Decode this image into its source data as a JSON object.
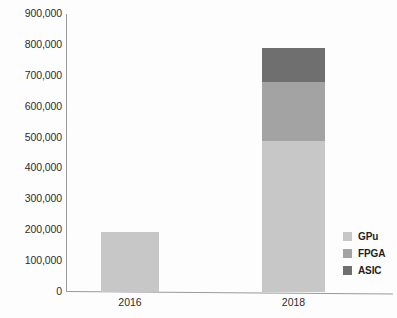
{
  "chart_data": {
    "type": "bar",
    "subtype": "stacked-bar",
    "title": "",
    "xlabel": "",
    "ylabel": "",
    "categories": [
      "2016",
      "2018"
    ],
    "series": [
      {
        "name": "GPu",
        "values": [
          195000,
          490000
        ],
        "color": "#c7c7c7"
      },
      {
        "name": "FPGA",
        "values": [
          0,
          190000
        ],
        "color": "#a3a3a3"
      },
      {
        "name": "ASIC",
        "values": [
          0,
          110000
        ],
        "color": "#6f6f6f"
      }
    ],
    "totals": [
      195000,
      790000
    ],
    "ylim": [
      0,
      900000
    ],
    "ytick_values": [
      0,
      100000,
      200000,
      300000,
      400000,
      500000,
      600000,
      700000,
      800000,
      900000
    ],
    "ytick_labels": [
      "0",
      "100,000",
      "200,000",
      "300,000",
      "400,000",
      "500,000",
      "600,000",
      "700,000",
      "800,000",
      "900,000"
    ],
    "grid": false,
    "legend_position": "right-bottom"
  },
  "axes": {
    "y_ticks": [
      {
        "label": "900,000",
        "value": 900000
      },
      {
        "label": "800,000",
        "value": 800000
      },
      {
        "label": "700,000",
        "value": 700000
      },
      {
        "label": "600,000",
        "value": 600000
      },
      {
        "label": "500,000",
        "value": 500000
      },
      {
        "label": "400,000",
        "value": 400000
      },
      {
        "label": "300,000",
        "value": 300000
      },
      {
        "label": "200,000",
        "value": 200000
      },
      {
        "label": "100,000",
        "value": 100000
      },
      {
        "label": "0",
        "value": 0
      }
    ],
    "x_ticks": [
      {
        "label": "2016"
      },
      {
        "label": "2018"
      }
    ]
  },
  "legend": {
    "items": [
      {
        "label": "GPu",
        "color": "#c7c7c7"
      },
      {
        "label": "FPGA",
        "color": "#a3a3a3"
      },
      {
        "label": "ASIC",
        "color": "#6f6f6f"
      }
    ]
  },
  "colors": {
    "axis": "#9a9a9a",
    "text": "#2c2c2c",
    "background": "#fdfdfd"
  }
}
